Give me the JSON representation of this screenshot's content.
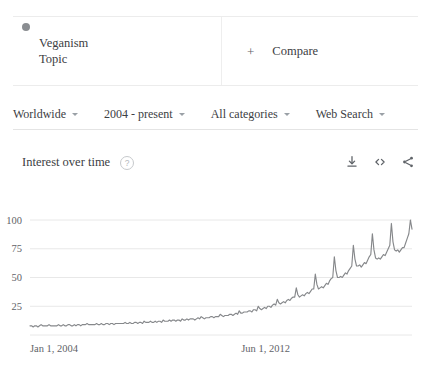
{
  "term_card": {
    "dot_color": "#8a8d91",
    "title": "Veganism",
    "subtitle": "Topic"
  },
  "compare": {
    "plus": "+",
    "label": "Compare"
  },
  "filters": [
    {
      "label": "Worldwide"
    },
    {
      "label": "2004 - present"
    },
    {
      "label": "All categories"
    },
    {
      "label": "Web Search"
    }
  ],
  "section": {
    "title": "Interest over time",
    "help": "?"
  },
  "actions": [
    {
      "name": "download-icon"
    },
    {
      "name": "embed-icon"
    },
    {
      "name": "share-icon"
    }
  ],
  "chart_data": {
    "type": "line",
    "title": "Interest over time",
    "xlabel": "",
    "ylabel": "",
    "grid": true,
    "legend_position": "top",
    "ylim": [
      0,
      100
    ],
    "yticks": [
      25,
      50,
      75,
      100
    ],
    "ytick_labels": [
      "25",
      "50",
      "75",
      "100"
    ],
    "xtick_labels": [
      "Jan 1, 2004",
      "Jun 1, 2012"
    ],
    "xtick_positions": [
      0,
      0.553
    ],
    "series": [
      {
        "name": "Veganism",
        "color": "#86888b",
        "values": [
          8,
          8,
          7,
          8,
          8,
          7,
          8,
          9,
          8,
          8,
          8,
          8,
          9,
          8,
          8,
          8,
          8,
          8,
          9,
          8,
          8,
          9,
          8,
          8,
          9,
          9,
          8,
          8,
          9,
          8,
          9,
          9,
          8,
          9,
          9,
          9,
          10,
          9,
          9,
          9,
          9,
          9,
          10,
          9,
          9,
          10,
          9,
          9,
          10,
          10,
          9,
          10,
          10,
          9,
          10,
          10,
          10,
          10,
          10,
          10,
          11,
          10,
          10,
          11,
          10,
          10,
          11,
          11,
          10,
          11,
          11,
          10,
          12,
          11,
          11,
          11,
          12,
          11,
          11,
          12,
          11,
          12,
          12,
          11,
          13,
          12,
          12,
          12,
          13,
          12,
          13,
          13,
          12,
          13,
          13,
          12,
          14,
          13,
          13,
          14,
          13,
          14,
          14,
          14,
          13,
          14,
          15,
          14,
          16,
          15,
          14,
          15,
          15,
          15,
          16,
          16,
          15,
          16,
          16,
          16,
          18,
          17,
          16,
          17,
          17,
          17,
          18,
          18,
          17,
          18,
          19,
          18,
          21,
          19,
          19,
          20,
          20,
          20,
          21,
          21,
          20,
          22,
          22,
          21,
          25,
          23,
          22,
          23,
          24,
          23,
          25,
          25,
          24,
          26,
          27,
          26,
          31,
          28,
          27,
          28,
          29,
          28,
          30,
          31,
          30,
          32,
          33,
          33,
          41,
          35,
          33,
          34,
          35,
          34,
          36,
          37,
          36,
          38,
          40,
          40,
          53,
          44,
          40,
          41,
          42,
          41,
          43,
          45,
          44,
          47,
          49,
          50,
          68,
          56,
          50,
          50,
          51,
          50,
          52,
          54,
          53,
          56,
          58,
          60,
          78,
          66,
          60,
          60,
          61,
          59,
          61,
          63,
          62,
          65,
          68,
          70,
          88,
          74,
          67,
          66,
          67,
          66,
          68,
          70,
          69,
          72,
          75,
          78,
          97,
          81,
          74,
          73,
          74,
          72,
          74,
          76,
          76,
          80,
          84,
          88,
          100,
          92
        ]
      }
    ]
  }
}
